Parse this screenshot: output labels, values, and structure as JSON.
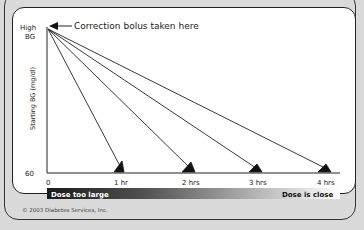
{
  "diagram": {
    "y_axis": {
      "label": "Starting BG (mg/dl)",
      "top_label_line1": "High",
      "top_label_line2": "BG",
      "bottom_label": "60"
    },
    "x_axis": {
      "ticks": [
        "0",
        "1 hr",
        "2 hrs",
        "3 hrs",
        "4 hrs"
      ]
    },
    "annotation": "Correction bolus taken here",
    "gradient_bar": {
      "left_label": "Dose too large",
      "right_label": "Dose is close",
      "start_color": "#1a1a1a",
      "end_color": "#ffffff"
    },
    "copyright": "© 2003 Diabetes Services, Inc."
  }
}
